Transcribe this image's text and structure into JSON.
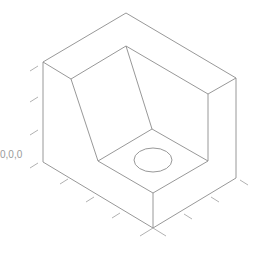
{
  "diagram": {
    "type": "isometric-3d-part",
    "origin_label": "0,0,0",
    "line_color": "#8c8c8c",
    "tick_color": "#a8a8a8"
  }
}
